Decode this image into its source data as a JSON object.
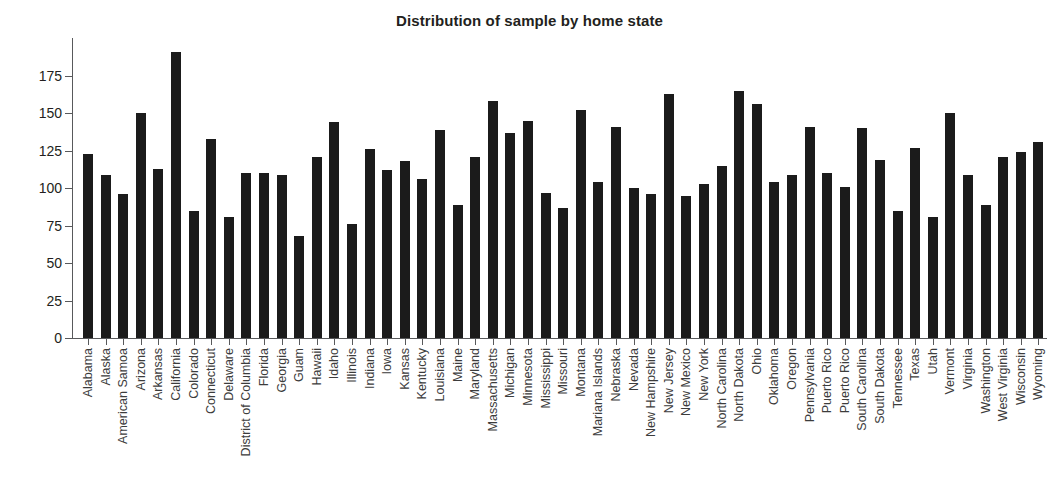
{
  "chart_data": {
    "type": "bar",
    "title": "Distribution of sample by home state",
    "xlabel": "",
    "ylabel": "",
    "ylim": [
      0,
      200
    ],
    "grid": false,
    "legend": null,
    "ytick_labels": [
      "0",
      "25",
      "50",
      "75",
      "100",
      "125",
      "150",
      "175"
    ],
    "ytick_values": [
      0,
      25,
      50,
      75,
      100,
      125,
      150,
      175
    ],
    "bar_color": "#1b1b1b",
    "categories": [
      "Alabama",
      "Alaska",
      "American Samoa",
      "Arizona",
      "Arkansas",
      "California",
      "Colorado",
      "Connecticut",
      "Delaware",
      "District of Columbia",
      "Florida",
      "Georgia",
      "Guam",
      "Hawaii",
      "Idaho",
      "Illinois",
      "Indiana",
      "Iowa",
      "Kansas",
      "Kentucky",
      "Louisiana",
      "Maine",
      "Maryland",
      "Massachusetts",
      "Michigan",
      "Minnesota",
      "Mississippi",
      "Missouri",
      "Montana",
      "Mariana Islands",
      "Nebraska",
      "Nevada",
      "New Hampshire",
      "New Jersey",
      "New Mexico",
      "New York",
      "North Carolina",
      "North Dakota",
      "Ohio",
      "Oklahoma",
      "Oregon",
      "Pennsylvania",
      "Puerto Rico",
      "Puerto Rico",
      "South Carolina",
      "South Dakota",
      "Tennessee",
      "Texas",
      "Utah",
      "Vermont",
      "Virginia",
      "Washington",
      "West Virginia",
      "Wisconsin",
      "Wyoming"
    ],
    "values": [
      123,
      109,
      96,
      150,
      113,
      191,
      85,
      133,
      81,
      110,
      110,
      109,
      68,
      121,
      144,
      76,
      126,
      112,
      118,
      106,
      139,
      89,
      121,
      158,
      137,
      145,
      97,
      87,
      152,
      104,
      141,
      100,
      96,
      163,
      95,
      103,
      115,
      165,
      156,
      104,
      109,
      141,
      110,
      101,
      140,
      119,
      85,
      127,
      81,
      150,
      109,
      89,
      121,
      124,
      131
    ]
  }
}
